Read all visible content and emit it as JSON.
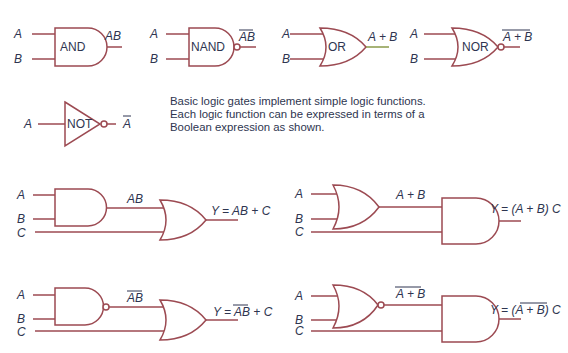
{
  "description": {
    "lines": [
      "Basic logic gates implement simple logic functions.",
      "Each logic function can be expressed in terms of a",
      "Boolean expression as shown."
    ]
  },
  "colors": {
    "wire": "#9c4a52",
    "text": "#2e3550",
    "background": "#ffffff"
  },
  "basic_gates": [
    {
      "name": "AND",
      "inputs": [
        "A",
        "B"
      ],
      "output": "AB",
      "output_overbar": false
    },
    {
      "name": "NAND",
      "inputs": [
        "A",
        "B"
      ],
      "output": "AB",
      "output_overbar": true
    },
    {
      "name": "OR",
      "inputs": [
        "A",
        "B"
      ],
      "output": "A + B",
      "output_overbar": false
    },
    {
      "name": "NOR",
      "inputs": [
        "A",
        "B"
      ],
      "output": "A + B",
      "output_overbar": true
    },
    {
      "name": "NOT",
      "inputs": [
        "A"
      ],
      "output": "A",
      "output_overbar": true
    }
  ],
  "circuits": [
    {
      "inputs": [
        "A",
        "B",
        "C"
      ],
      "intermediate": "AB",
      "intermediate_overbar": false,
      "output": "Y = AB + C"
    },
    {
      "inputs": [
        "A",
        "B",
        "C"
      ],
      "intermediate": "A + B",
      "intermediate_overbar": false,
      "output": "Y = (A + B) C"
    },
    {
      "inputs": [
        "A",
        "B",
        "C"
      ],
      "intermediate": "AB",
      "intermediate_overbar": true,
      "output": "Y = AB + C",
      "output_overbar_part": "AB"
    },
    {
      "inputs": [
        "A",
        "B",
        "C"
      ],
      "intermediate": "A + B",
      "intermediate_overbar": true,
      "output": "Y = (A + B) C",
      "output_overbar_part": "A + B"
    }
  ]
}
